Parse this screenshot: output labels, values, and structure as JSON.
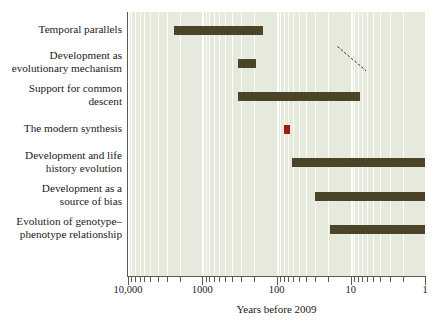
{
  "chart_data": {
    "type": "bar",
    "orientation": "horizontal-timeline",
    "title": "",
    "xlabel": "Years before 2009",
    "ylabel": "",
    "xscale": "log-reversed",
    "xlim": [
      10000,
      1
    ],
    "grid": true,
    "legend": null,
    "bar_color": "#4b4429",
    "point_color": "#9e1b13",
    "plot_background": "#e6eadd",
    "x_tick_labels": [
      "10,000",
      "1000",
      "100",
      "10",
      "1"
    ],
    "x_tick_values": [
      10000,
      1000,
      100,
      10,
      1
    ],
    "categories": [
      "Temporal parallels",
      "Development as\nevolutionary mechanism",
      "Support for common\ndescent",
      "The modern synthesis",
      "Development and life\nhistory evolution",
      "Development as a\nsource of bias",
      "Evolution of genotype–\nphenotype relationship"
    ],
    "bars": [
      {
        "label": "Temporal parallels",
        "start_years_before": 2400,
        "end_years_before": 150,
        "kind": "range"
      },
      {
        "label": "Development as evolutionary mechanism",
        "start_years_before": 330,
        "end_years_before": 190,
        "kind": "range"
      },
      {
        "label": "Support for common descent",
        "start_years_before": 330,
        "end_years_before": 7.5,
        "kind": "range"
      },
      {
        "label": "The modern synthesis",
        "start_years_before": 80,
        "end_years_before": 65,
        "kind": "point"
      },
      {
        "label": "Development and life history evolution",
        "start_years_before": 62,
        "end_years_before": 1,
        "kind": "range"
      },
      {
        "label": "Development as a source of bias",
        "start_years_before": 30,
        "end_years_before": 1,
        "kind": "range"
      },
      {
        "label": "Evolution of genotype–phenotype relationship",
        "start_years_before": 19,
        "end_years_before": 1,
        "kind": "range"
      }
    ],
    "annotations": [
      {
        "type": "connector-dashed",
        "from": "Temporal parallels",
        "to": "Development as evolutionary mechanism"
      }
    ]
  }
}
